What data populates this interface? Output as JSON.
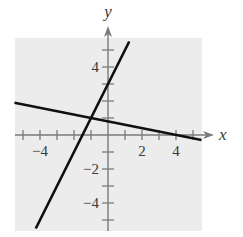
{
  "chart_data": {
    "type": "line",
    "title": "",
    "xlabel": "x",
    "ylabel": "y",
    "xlim": [
      -5.5,
      5.5
    ],
    "ylim": [
      -5.5,
      5.5
    ],
    "grid": false,
    "background": "#ececec",
    "x_ticks": [
      -5,
      -4,
      -3,
      -2,
      -1,
      1,
      2,
      3,
      4,
      5
    ],
    "y_ticks": [
      -5,
      -4,
      -3,
      -2,
      -1,
      1,
      2,
      3,
      4,
      5
    ],
    "x_tick_labels": [
      {
        "value": -4,
        "label": "−4"
      },
      {
        "value": 2,
        "label": "2"
      },
      {
        "value": 4,
        "label": "4"
      }
    ],
    "y_tick_labels": [
      {
        "value": 4,
        "label": "4"
      },
      {
        "value": -2,
        "label": "−2"
      },
      {
        "value": -4,
        "label": "−4"
      }
    ],
    "series": [
      {
        "name": "steep line",
        "equation": "y = 2x + 3",
        "slope": 2,
        "intercept": 3,
        "x": [
          -4.25,
          1.25
        ],
        "y": [
          -5.5,
          5.5
        ],
        "color": "#111111"
      },
      {
        "name": "shallow line",
        "equation": "y = -0.2x + 0.8",
        "slope": -0.2,
        "intercept": 0.8,
        "x": [
          -5.5,
          5.5
        ],
        "y": [
          1.9,
          -0.3
        ],
        "color": "#111111"
      }
    ],
    "annotations": [
      {
        "type": "intersection",
        "x": -1,
        "y": 1
      }
    ]
  }
}
